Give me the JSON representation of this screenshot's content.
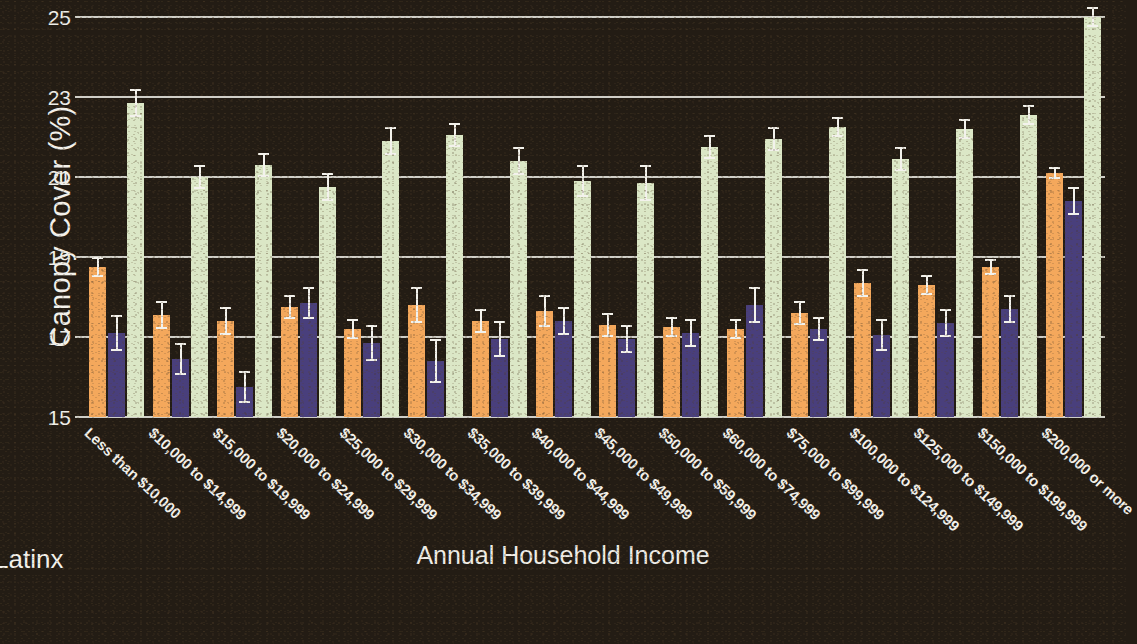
{
  "chart_data": {
    "type": "bar",
    "title": "",
    "xlabel": "Annual Household Income",
    "ylabel": "Canopy Cover (%)",
    "ylim": [
      15,
      25
    ],
    "yticks": [
      15,
      17,
      19,
      21,
      23,
      25
    ],
    "grid": true,
    "legend_position": "bottom-left",
    "legend_visible_entries": [
      "Latinx"
    ],
    "colors": {
      "series_1_orange": "#f4a85c",
      "series_2_purple": "#493f7c",
      "series_3_green": "#dbe7c6",
      "background": "#231c14",
      "gridline": "#cfcec7",
      "text": "#f2f0ea",
      "errorbar": "#f3f2ec"
    },
    "categories": [
      "Less than $10,000",
      "$10,000 to $14,999",
      "$15,000 to $19,999",
      "$20,000 to $24,999",
      "$25,000 to $29,999",
      "$30,000 to $34,999",
      "$35,000 to $39,999",
      "$40,000 to $44,999",
      "$45,000 to $49,999",
      "$50,000 to $59,999",
      "$60,000 to $74,999",
      "$75,000 to $99,999",
      "$100,000 to $124,999",
      "$125,000 to $149,999",
      "$150,000 to $199,999",
      "$200,000 or more"
    ],
    "series": [
      {
        "name": "Latinx",
        "color": "#f4a85c",
        "values": [
          18.75,
          17.55,
          17.4,
          17.75,
          17.2,
          17.8,
          17.4,
          17.65,
          17.3,
          17.25,
          17.2,
          17.6,
          18.35,
          18.3,
          18.75,
          21.1
        ],
        "err_low": [
          0.25,
          0.35,
          0.35,
          0.3,
          0.25,
          0.45,
          0.3,
          0.4,
          0.3,
          0.25,
          0.25,
          0.3,
          0.35,
          0.25,
          0.2,
          0.15
        ],
        "err_high": [
          0.25,
          0.35,
          0.35,
          0.3,
          0.25,
          0.45,
          0.3,
          0.4,
          0.3,
          0.25,
          0.25,
          0.3,
          0.35,
          0.25,
          0.2,
          0.15
        ]
      },
      {
        "name": "series-2",
        "color": "#493f7c",
        "values": [
          17.1,
          16.45,
          15.75,
          17.85,
          16.85,
          16.4,
          16.95,
          17.4,
          16.95,
          17.1,
          17.8,
          17.2,
          17.05,
          17.35,
          17.7,
          20.4
        ],
        "err_low": [
          0.45,
          0.4,
          0.4,
          0.4,
          0.45,
          0.55,
          0.45,
          0.35,
          0.35,
          0.35,
          0.45,
          0.3,
          0.4,
          0.35,
          0.35,
          0.35
        ],
        "err_high": [
          0.45,
          0.4,
          0.4,
          0.4,
          0.45,
          0.55,
          0.45,
          0.35,
          0.35,
          0.35,
          0.45,
          0.3,
          0.4,
          0.35,
          0.35,
          0.35
        ]
      },
      {
        "name": "series-3",
        "color": "#dbe7c6",
        "values": [
          22.85,
          21.0,
          21.3,
          20.75,
          21.9,
          22.05,
          21.4,
          20.9,
          20.85,
          21.75,
          21.95,
          22.25,
          21.45,
          22.2,
          22.55,
          25.0
        ],
        "err_low": [
          0.35,
          0.3,
          0.3,
          0.35,
          0.35,
          0.3,
          0.35,
          0.4,
          0.45,
          0.3,
          0.3,
          0.25,
          0.3,
          0.25,
          0.25,
          0.25
        ],
        "err_high": [
          0.35,
          0.3,
          0.3,
          0.35,
          0.35,
          0.3,
          0.35,
          0.4,
          0.45,
          0.3,
          0.3,
          0.25,
          0.3,
          0.25,
          0.25,
          0.25
        ]
      }
    ]
  },
  "legend": {
    "label": "Latinx"
  }
}
